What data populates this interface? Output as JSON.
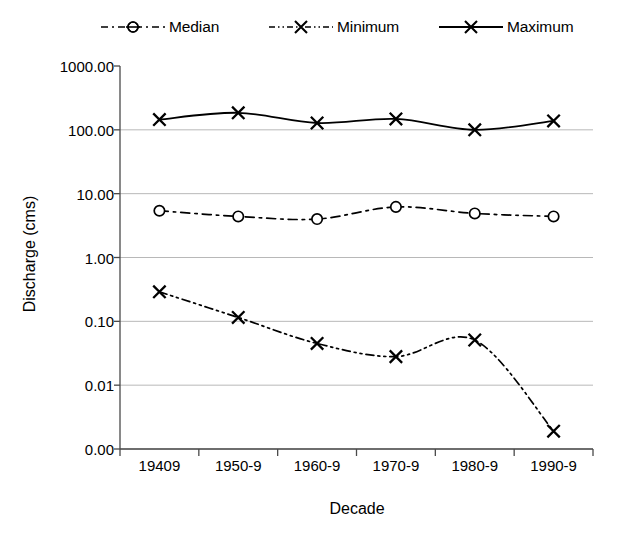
{
  "chart_data": {
    "type": "line",
    "title": "",
    "xlabel": "Decade",
    "ylabel": "Discharge (cms)",
    "categories": [
      "19409",
      "1950-9",
      "1960-9",
      "1970-9",
      "1980-9",
      "1990-9"
    ],
    "y_scale": "log",
    "ylim": [
      0.001,
      1000
    ],
    "y_tick_labels": [
      "1000.00",
      "100.00",
      "10.00",
      "1.00",
      "0.10",
      "0.01",
      "0.00"
    ],
    "y_tick_values": [
      1000,
      100,
      10,
      1,
      0.1,
      0.01,
      0.001
    ],
    "grid": true,
    "grid_axis": "y",
    "legend_position": "top",
    "series": [
      {
        "name": "Median",
        "marker": "circle",
        "line_style": "dash-dot",
        "color": "#000000",
        "values": [
          5.4,
          4.4,
          4.0,
          6.2,
          4.9,
          4.4
        ]
      },
      {
        "name": "Minimum",
        "marker": "x",
        "line_style": "dash-dot-dot",
        "color": "#000000",
        "values": [
          0.29,
          0.115,
          0.045,
          0.028,
          0.051,
          0.0019
        ]
      },
      {
        "name": "Maximum",
        "marker": "x",
        "line_style": "solid",
        "color": "#000000",
        "values": [
          145,
          185,
          128,
          148,
          100,
          138
        ]
      }
    ]
  },
  "legend": {
    "items": [
      {
        "label": "Median"
      },
      {
        "label": "Minimum"
      },
      {
        "label": "Maximum"
      }
    ]
  },
  "axes": {
    "y_title": "Discharge (cms)",
    "x_title": "Decade"
  }
}
